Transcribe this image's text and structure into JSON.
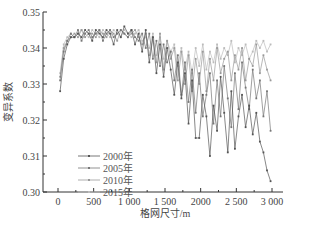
{
  "chart_data": {
    "type": "line",
    "title": "",
    "xlabel": "格网尺寸/m",
    "ylabel": "变异系数",
    "xlim": [
      -150,
      3050
    ],
    "ylim": [
      0.3,
      0.35
    ],
    "xticks": [
      0,
      500,
      1000,
      1500,
      2000,
      2500,
      3000
    ],
    "xtick_labels": [
      "0",
      "500",
      "1 000",
      "1 500",
      "2000",
      "2 500",
      "3 000"
    ],
    "yticks": [
      0.3,
      0.31,
      0.32,
      0.33,
      0.34,
      0.35
    ],
    "ytick_labels": [
      "0.30",
      "0.31",
      "0.32",
      "0.33",
      "0.34",
      "0.35"
    ],
    "grid": false,
    "legend_position": "lower-left",
    "x": [
      30,
      80,
      130,
      180,
      230,
      280,
      330,
      380,
      430,
      480,
      530,
      580,
      630,
      680,
      730,
      780,
      830,
      880,
      930,
      980,
      1030,
      1080,
      1130,
      1180,
      1230,
      1280,
      1330,
      1380,
      1430,
      1480,
      1530,
      1580,
      1630,
      1680,
      1730,
      1780,
      1830,
      1880,
      1930,
      1980,
      2030,
      2080,
      2130,
      2180,
      2230,
      2280,
      2330,
      2380,
      2430,
      2480,
      2530,
      2580,
      2630,
      2680,
      2730,
      2780,
      2830,
      2880,
      2930,
      2980
    ],
    "series": [
      {
        "name": "2000年",
        "color": "#555555",
        "values": [
          0.328,
          0.337,
          0.341,
          0.343,
          0.343,
          0.344,
          0.343,
          0.345,
          0.344,
          0.342,
          0.345,
          0.344,
          0.343,
          0.345,
          0.344,
          0.341,
          0.345,
          0.343,
          0.346,
          0.344,
          0.345,
          0.341,
          0.344,
          0.339,
          0.345,
          0.336,
          0.343,
          0.333,
          0.341,
          0.332,
          0.34,
          0.334,
          0.327,
          0.336,
          0.326,
          0.333,
          0.319,
          0.331,
          0.315,
          0.315,
          0.327,
          0.321,
          0.31,
          0.324,
          0.317,
          0.332,
          0.322,
          0.311,
          0.328,
          0.312,
          0.321,
          0.327,
          0.318,
          0.324,
          0.316,
          0.322,
          0.314,
          0.311,
          0.306,
          0.303
        ]
      },
      {
        "name": "2005年",
        "color": "#777777",
        "values": [
          0.331,
          0.339,
          0.342,
          0.344,
          0.343,
          0.345,
          0.342,
          0.344,
          0.345,
          0.343,
          0.344,
          0.345,
          0.342,
          0.344,
          0.345,
          0.343,
          0.344,
          0.345,
          0.344,
          0.343,
          0.345,
          0.343,
          0.342,
          0.344,
          0.34,
          0.344,
          0.337,
          0.342,
          0.335,
          0.341,
          0.336,
          0.339,
          0.331,
          0.338,
          0.327,
          0.336,
          0.325,
          0.334,
          0.322,
          0.333,
          0.321,
          0.327,
          0.333,
          0.319,
          0.331,
          0.321,
          0.335,
          0.326,
          0.318,
          0.333,
          0.323,
          0.336,
          0.329,
          0.323,
          0.334,
          0.326,
          0.331,
          0.321,
          0.328,
          0.317
        ]
      },
      {
        "name": "2010年",
        "color": "#999999",
        "values": [
          0.332,
          0.34,
          0.342,
          0.343,
          0.344,
          0.343,
          0.345,
          0.343,
          0.344,
          0.344,
          0.343,
          0.345,
          0.344,
          0.343,
          0.345,
          0.344,
          0.342,
          0.345,
          0.344,
          0.343,
          0.344,
          0.345,
          0.343,
          0.341,
          0.344,
          0.338,
          0.343,
          0.336,
          0.344,
          0.334,
          0.342,
          0.337,
          0.34,
          0.331,
          0.339,
          0.33,
          0.338,
          0.328,
          0.337,
          0.33,
          0.339,
          0.328,
          0.337,
          0.331,
          0.34,
          0.333,
          0.337,
          0.339,
          0.331,
          0.338,
          0.334,
          0.34,
          0.331,
          0.337,
          0.335,
          0.341,
          0.333,
          0.338,
          0.334,
          0.331
        ]
      },
      {
        "name": "2015年",
        "color": "#bbbbbb",
        "values": [
          0.333,
          0.341,
          0.343,
          0.344,
          0.343,
          0.344,
          0.345,
          0.344,
          0.343,
          0.345,
          0.344,
          0.343,
          0.345,
          0.344,
          0.343,
          0.345,
          0.344,
          0.343,
          0.345,
          0.344,
          0.343,
          0.344,
          0.345,
          0.342,
          0.343,
          0.34,
          0.344,
          0.338,
          0.343,
          0.337,
          0.342,
          0.339,
          0.341,
          0.335,
          0.34,
          0.334,
          0.339,
          0.333,
          0.34,
          0.335,
          0.341,
          0.334,
          0.339,
          0.336,
          0.341,
          0.337,
          0.34,
          0.338,
          0.342,
          0.336,
          0.34,
          0.338,
          0.341,
          0.337,
          0.339,
          0.342,
          0.34,
          0.342,
          0.339,
          0.341
        ]
      }
    ]
  }
}
